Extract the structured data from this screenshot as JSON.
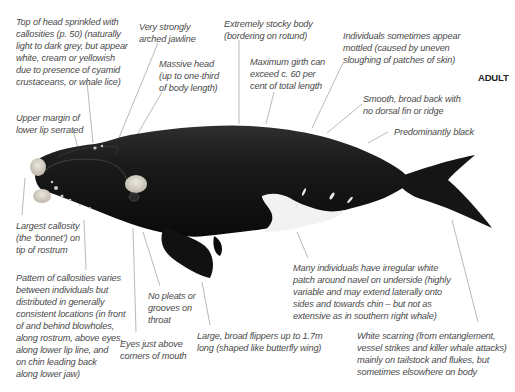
{
  "title": "ADULT",
  "labels": {
    "top_of_head": "Top of head sprinkled with\ncallosities (p. 50) (naturally\nlight to dark grey, but appear\nwhite, cream or yellowish\ndue to presence of cyamid\ncrustaceans, or whale lice)",
    "jawline": "Very strongly\narched jawline",
    "stocky_body": "Extremely stocky body\n(bordering on rotund)",
    "massive_head": "Massive head\n(up to one-third\nof body length)",
    "max_girth": "Maximum girth can\nexceed c. 60 per\ncent of total length",
    "mottled": "Individuals sometimes appear\nmottled (caused by uneven\nsloughing of patches of skin)",
    "smooth_back": "Smooth, broad back with\nno dorsal fin or ridge",
    "predominantly_black": "Predominantly black",
    "upper_margin": "Upper margin of\nlower lip serrated",
    "largest_callosity": "Largest callosity\n(the ‘bonnet’) on\ntip of rostrum",
    "pattern_callosities": "Pattern of callosities varies\nbetween individuals but\ndistributed in generally\nconsistent locations (in front\nof and behind blowholes,\nalong rostrum, above eyes,\nalong lower lip line, and\non chin leading back\nalong lower jaw)",
    "no_pleats": "No pleats or\ngrooves on\nthroat",
    "eyes": "Eyes just above\ncorners of mouth",
    "flippers": "Large, broad flippers up to 1.7m\nlong (shaped like butterfly wing)",
    "white_patch": "Many individuals have irregular white\npatch around navel on underside (highly\nvariable and may extend laterally onto\nsides and towards chin – but not as\nextensive as in southern right whale)",
    "white_scarring": "White scarring (from entanglement,\nvessel strikes and killer whale attacks)\nmainly on tailstock and flukes, but\nsometimes elsowhere on body"
  },
  "colors": {
    "whale_body": "#141414",
    "callosity": "#d9d4c8",
    "belly_patch": "#f2f2f2",
    "leader_line": "#8a8a8a",
    "label_text": "#4a4a4a"
  }
}
